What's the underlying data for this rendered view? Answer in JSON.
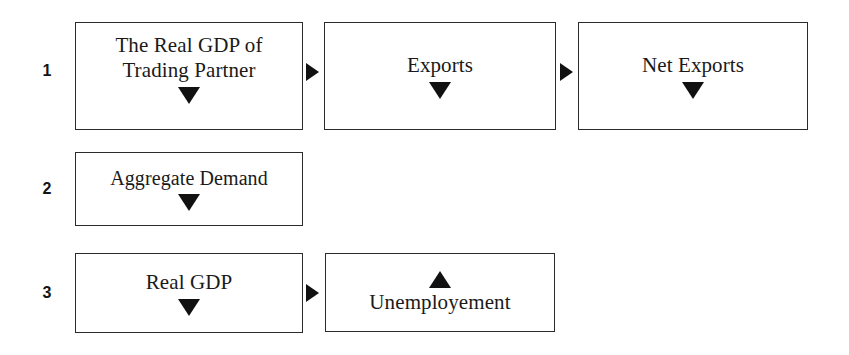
{
  "diagram": {
    "background_color": "#ffffff",
    "line_color": "#2b2b2b",
    "text_color": "#1a1a1a",
    "arrow_color": "#111111",
    "rows": [
      {
        "number": "1",
        "boxes": [
          {
            "label": "The Real GDP of\nTrading Partner",
            "indicator": "down-triangle",
            "indicator_position": "below"
          },
          {
            "label": "Exports",
            "indicator": "down-triangle",
            "indicator_position": "below"
          },
          {
            "label": "Net Exports",
            "indicator": "down-triangle",
            "indicator_position": "below"
          }
        ],
        "connectors": [
          "right-triangle",
          "right-triangle"
        ]
      },
      {
        "number": "2",
        "boxes": [
          {
            "label": "Aggregate Demand",
            "indicator": "down-triangle",
            "indicator_position": "below"
          }
        ],
        "connectors": []
      },
      {
        "number": "3",
        "boxes": [
          {
            "label": "Real GDP",
            "indicator": "down-triangle",
            "indicator_position": "below"
          },
          {
            "label": "Unemployement",
            "indicator": "up-triangle",
            "indicator_position": "above"
          }
        ],
        "connectors": [
          "right-triangle"
        ]
      }
    ]
  }
}
